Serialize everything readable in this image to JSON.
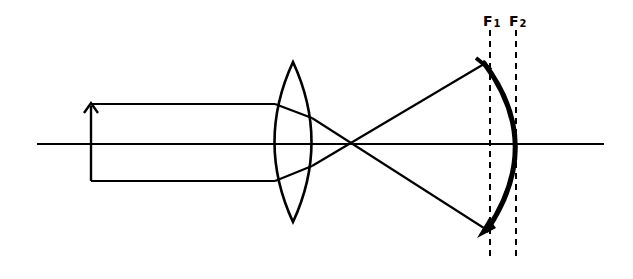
{
  "diagram": {
    "colors": {
      "ink": "#000000",
      "background": "#ffffff"
    },
    "labels": {
      "f1": {
        "main": "F",
        "sub": "1"
      },
      "f2": {
        "main": "F",
        "sub": "2"
      }
    },
    "elements": [
      {
        "id": "optical-axis",
        "type": "line",
        "from": [
          37,
          144
        ],
        "to": [
          604,
          144
        ]
      },
      {
        "id": "object-arrow",
        "type": "arrow",
        "from": [
          91,
          181
        ],
        "to": [
          91,
          103
        ]
      },
      {
        "id": "converging-lens",
        "type": "biconvex-lens",
        "center": [
          293,
          142
        ],
        "top_y": 62,
        "bottom_y": 222
      },
      {
        "id": "focal-plane-f1",
        "type": "dashed-line",
        "x": 490,
        "y_range": [
          30,
          260
        ]
      },
      {
        "id": "focal-plane-f2",
        "type": "dashed-line",
        "x": 516,
        "y_range": [
          30,
          260
        ]
      },
      {
        "id": "curved-image-surface",
        "type": "thick-arc",
        "from": [
          483,
          63
        ],
        "through": [
          518,
          144
        ],
        "to": [
          487,
          232
        ]
      }
    ]
  }
}
